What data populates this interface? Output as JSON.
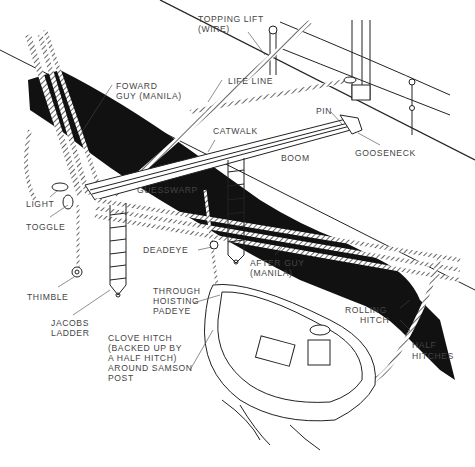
{
  "figure": {
    "colors": {
      "ink": "#222222",
      "hull_shadow": "#111111",
      "paper": "#ffffff",
      "label": "#444444"
    },
    "labels": {
      "topping_lift": "TOPPING LIFT",
      "topping_lift_sub": "(WIRE)",
      "life_line": "LIFE LINE",
      "forward_guy": "FOWARD",
      "forward_guy_sub": "GUY (MANILA)",
      "pin": "PIN",
      "catwalk": "CATWALK",
      "boom": "BOOM",
      "gooseneck": "GOOSENECK",
      "guesswarp": "GUESSWARP",
      "light": "LIGHT",
      "toggle": "TOGGLE",
      "deadeye": "DEADEYE",
      "after_guy": "AFTER GUY",
      "after_guy_sub": "(MANILA)",
      "thimble": "THIMBLE",
      "jacobs_ladder": "JACOBS",
      "jacobs_ladder_sub": "LADDER",
      "through_hoisting_padeye_1": "THROUGH",
      "through_hoisting_padeye_2": "HOISTING",
      "through_hoisting_padeye_3": "PADEYE",
      "rolling_hitch": "ROLLING",
      "rolling_hitch_sub": "HITCH",
      "clove_hitch_1": "CLOVE HITCH",
      "clove_hitch_2": "(BACKED UP BY",
      "clove_hitch_3": "A HALF HITCH)",
      "clove_hitch_4": "AROUND SAMSON",
      "clove_hitch_5": "POST",
      "half_hitches": "HALF",
      "half_hitches_sub": "HITCHES"
    }
  }
}
